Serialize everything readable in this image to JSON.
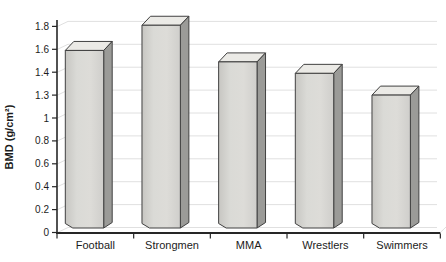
{
  "chart_data": {
    "type": "bar",
    "title": "",
    "categories": [
      "Football",
      "Strongmen",
      "MMA",
      "Wrestlers",
      "Swimmers"
    ],
    "values": [
      1.6,
      1.8,
      1.5,
      1.4,
      1.3
    ],
    "height_units": [
      1.59,
      1.81,
      1.49,
      1.39,
      1.2
    ],
    "xlabel": "",
    "ylabel": "BMD (g/cm²)",
    "ytick_labels": [
      "0",
      "0.2",
      "0.4",
      "0.6",
      "0.8",
      "1",
      "1.3",
      "1.4",
      "1.6",
      "1.8"
    ],
    "ylim": [
      0,
      1.9
    ],
    "grid": true,
    "legend": "none",
    "style": "pseudo-3d-bars",
    "colors": {
      "bar_front_left": "#c7c6c2",
      "bar_front_mid": "#dddcd8",
      "bar_front_right": "#cfcecb",
      "bar_top": "#ebeae6",
      "bar_side": "#9b9b98",
      "bar_outline": "#404040",
      "gridline": "#e0e0e0",
      "axis": "#262626",
      "text": "#1c1c1c",
      "background": "#ffffff"
    }
  }
}
